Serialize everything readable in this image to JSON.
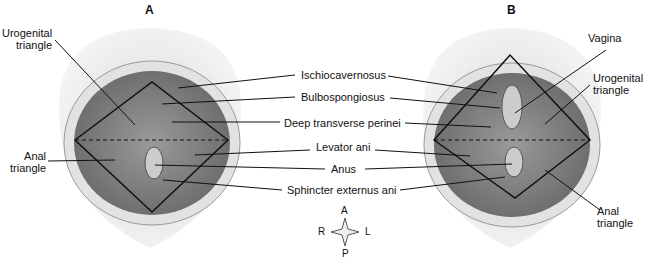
{
  "panels": {
    "a": "A",
    "b": "B"
  },
  "left_labels": {
    "urogenital_l1": "Urogenital",
    "urogenital_l2": "triangle",
    "anal_l1": "Anal",
    "anal_l2": "triangle"
  },
  "center_labels": [
    "Ischiocavernosus",
    "Bulbospongiosus",
    "Deep transverse perinei",
    "Levator ani",
    "Anus",
    "Sphincter externus ani"
  ],
  "right_labels": {
    "vagina": "Vagina",
    "urogenital_l1": "Urogenital",
    "urogenital_l2": "triangle",
    "anal_l1": "Anal",
    "anal_l2": "triangle"
  },
  "compass": {
    "a": "A",
    "p": "P",
    "r": "R",
    "l": "L"
  }
}
